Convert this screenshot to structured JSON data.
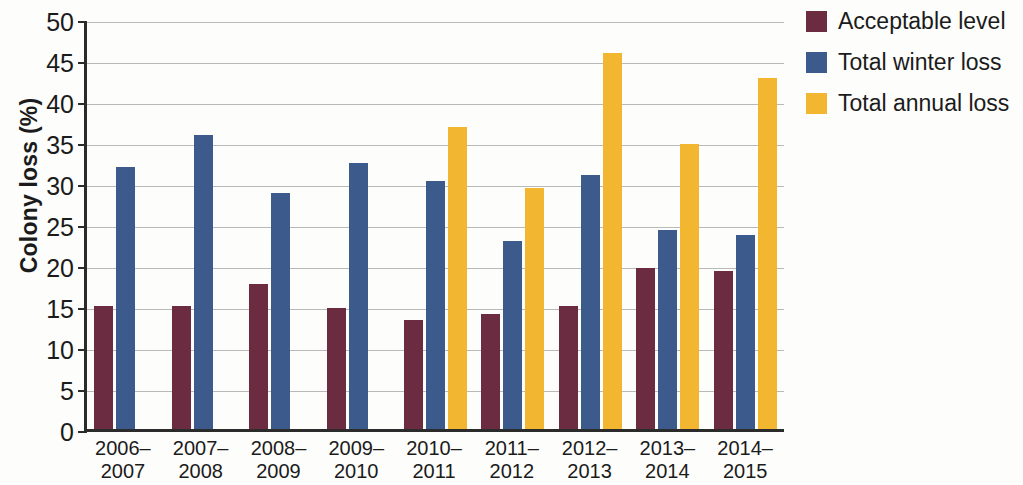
{
  "chart_data": {
    "type": "bar",
    "title": "",
    "xlabel": "",
    "ylabel": "Colony loss (%)",
    "ylim": [
      0,
      50
    ],
    "ytick_step": 5,
    "yticks": [
      50,
      45,
      40,
      35,
      30,
      25,
      20,
      15,
      10,
      5,
      0
    ],
    "grid": true,
    "legend_position": "right",
    "categories": [
      "2006–\n2007",
      "2007–\n2008",
      "2008–\n2009",
      "2009–\n2010",
      "2010–\n2011",
      "2011–\n2012",
      "2012–\n2013",
      "2013–\n2014",
      "2014–\n2015"
    ],
    "category_lines": [
      [
        "2006–",
        "2007"
      ],
      [
        "2007–",
        "2008"
      ],
      [
        "2008–",
        "2009"
      ],
      [
        "2009–",
        "2010"
      ],
      [
        "2010–",
        "2011"
      ],
      [
        "2011–",
        "2012"
      ],
      [
        "2012–",
        "2013"
      ],
      [
        "2013–",
        "2014"
      ],
      [
        "2014–",
        "2015"
      ]
    ],
    "series": [
      {
        "name": "Acceptable level",
        "color": "#6b2b40",
        "values": [
          15.0,
          15.0,
          17.7,
          14.8,
          13.3,
          14.0,
          15.0,
          19.6,
          19.3
        ]
      },
      {
        "name": "Total winter loss",
        "color": "#3c5a8c",
        "values": [
          31.9,
          35.9,
          28.8,
          32.5,
          30.3,
          22.9,
          31.0,
          24.3,
          23.7
        ]
      },
      {
        "name": "Total annual loss",
        "color": "#f2b630",
        "values": [
          null,
          null,
          null,
          null,
          36.8,
          29.4,
          45.8,
          34.7,
          42.8
        ]
      }
    ]
  },
  "legend": {
    "items": [
      {
        "label": "Acceptable level",
        "color": "#6b2b40"
      },
      {
        "label": "Total winter loss",
        "color": "#3c5a8c"
      },
      {
        "label": "Total annual loss",
        "color": "#f2b630"
      }
    ]
  }
}
